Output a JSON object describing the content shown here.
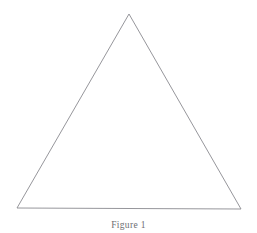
{
  "figure": {
    "caption": "Figure 1",
    "background_color": "#ffffff",
    "stroke_color": "#8a8a90",
    "caption_color": "#6e6e72",
    "stroke_width": 0.9,
    "shape": {
      "name": "triangle",
      "kind": "isosceles-triangle",
      "vertices": [
        {
          "label": "apex",
          "x": 129,
          "y": 14
        },
        {
          "label": "bottom-right",
          "x": 241,
          "y": 209
        },
        {
          "label": "bottom-left",
          "x": 17,
          "y": 208
        }
      ],
      "points_attr": "129,14 241,209 17,208",
      "fill": "none"
    }
  }
}
